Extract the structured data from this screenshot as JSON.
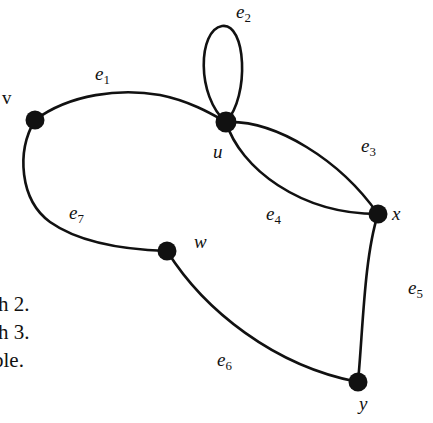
{
  "figure": {
    "type": "undirected-multigraph-diagram",
    "background_color": "#ffffff",
    "ink_color": "#111111"
  },
  "vertices": [
    {
      "id": "v",
      "label": "v",
      "style": "upright",
      "cx": 35,
      "cy": 120,
      "r": 9.5,
      "label_x": 2,
      "label_y": 88
    },
    {
      "id": "u",
      "label": "u",
      "style": "italic",
      "cx": 226,
      "cy": 122,
      "r": 10.5,
      "label_x": 213,
      "label_y": 142
    },
    {
      "id": "w",
      "label": "w",
      "style": "italic",
      "cx": 167,
      "cy": 251,
      "r": 9.5,
      "label_x": 194,
      "label_y": 232
    },
    {
      "id": "x",
      "label": "x",
      "style": "italic",
      "cx": 378,
      "cy": 214,
      "r": 9.5,
      "label_x": 392,
      "label_y": 204
    },
    {
      "id": "y",
      "label": "y",
      "style": "italic",
      "cx": 358,
      "cy": 382,
      "r": 9.5,
      "label_x": 359,
      "label_y": 394
    }
  ],
  "edges": [
    {
      "id": "e1",
      "label": "e",
      "sub": "1",
      "from": "v",
      "to": "u",
      "label_x": 95,
      "label_y": 64,
      "path": "M 35 120 C 70 94, 120 88, 160 95 C 190 101, 212 114, 226 122"
    },
    {
      "id": "e2",
      "label": "e",
      "sub": "2",
      "from": "u",
      "to": "u",
      "kind": "loop",
      "label_x": 236,
      "label_y": 2,
      "path": "M 226 122 C 196 96, 198 30, 222 26 C 246 22, 250 96, 226 122"
    },
    {
      "id": "e3",
      "label": "e",
      "sub": "3",
      "from": "u",
      "to": "x",
      "label_x": 361,
      "label_y": 136,
      "path": "M 226 122 C 276 120, 340 160, 378 214"
    },
    {
      "id": "e4",
      "label": "e",
      "sub": "4",
      "from": "u",
      "to": "x",
      "label_x": 266,
      "label_y": 204,
      "path": "M 226 122 C 240 168, 300 214, 378 214"
    },
    {
      "id": "e5",
      "label": "e",
      "sub": "5",
      "from": "x",
      "to": "y",
      "label_x": 408,
      "label_y": 278,
      "path": "M 378 214 C 364 258, 363 330, 358 382"
    },
    {
      "id": "e6",
      "label": "e",
      "sub": "6",
      "from": "w",
      "to": "y",
      "label_x": 217,
      "label_y": 350,
      "path": "M 167 251 C 204 310, 274 366, 358 382"
    },
    {
      "id": "e7",
      "label": "e",
      "sub": "7",
      "from": "v",
      "to": "w",
      "label_x": 69,
      "label_y": 203,
      "path": "M 35 120 C 16 152, 20 200, 50 222 C 84 246, 136 250, 167 251"
    }
  ],
  "page_text": {
    "lines": [
      {
        "text": "h 2.",
        "x": -2,
        "y": 294
      },
      {
        "text": "h 3.",
        "x": -2,
        "y": 322
      },
      {
        "text": "ble.",
        "x": -7,
        "y": 350
      }
    ]
  }
}
